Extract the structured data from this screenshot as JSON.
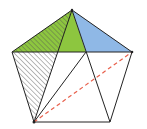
{
  "diagram": {
    "type": "geometry",
    "shape": "regular pentagon with diagonals",
    "vertices": {
      "top": [
        72,
        10
      ],
      "left": [
        12,
        52
      ],
      "right": [
        132,
        52
      ],
      "bottom_left": [
        34,
        122
      ],
      "bottom_right": [
        110,
        122
      ]
    },
    "intersections": {
      "p_left": [
        58,
        52
      ],
      "p_right": [
        86,
        52
      ]
    },
    "colors": {
      "green": "#8dc63f",
      "blue": "#8fb8e6",
      "stroke": "#222222",
      "hatch": "#555555",
      "dashed": "#e8604c"
    },
    "regions": [
      {
        "name": "green-triangle",
        "fill": "green"
      },
      {
        "name": "blue-triangle",
        "fill": "blue"
      },
      {
        "name": "hatched-region",
        "fill": "hatch"
      }
    ],
    "dashed_line": {
      "from": "bottom_left",
      "to": "right"
    }
  }
}
